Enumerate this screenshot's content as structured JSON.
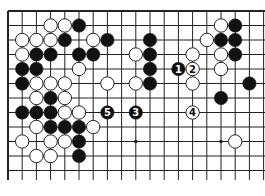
{
  "board": {
    "cols": 19,
    "rows_visible": 12,
    "origin_x": 8,
    "origin_y": 11,
    "spacing_x": 14.2,
    "spacing_y": 14.5,
    "line_bottom_y": 180,
    "line_right_x": 265,
    "edges": [
      "top",
      "left"
    ],
    "line_color": "#222222",
    "background": "#ffffff",
    "star_points": [
      [
        9,
        9
      ],
      [
        15,
        9
      ]
    ]
  },
  "stones": [
    {
      "c": 3,
      "r": 1,
      "color": "white"
    },
    {
      "c": 4,
      "r": 1,
      "color": "white"
    },
    {
      "c": 5,
      "r": 1,
      "color": "black"
    },
    {
      "c": 15,
      "r": 1,
      "color": "white"
    },
    {
      "c": 16,
      "r": 1,
      "color": "black"
    },
    {
      "c": 1,
      "r": 2,
      "color": "white"
    },
    {
      "c": 2,
      "r": 2,
      "color": "white"
    },
    {
      "c": 3,
      "r": 2,
      "color": "white"
    },
    {
      "c": 4,
      "r": 2,
      "color": "black"
    },
    {
      "c": 6,
      "r": 2,
      "color": "white"
    },
    {
      "c": 7,
      "r": 2,
      "color": "black"
    },
    {
      "c": 10,
      "r": 2,
      "color": "black"
    },
    {
      "c": 14,
      "r": 2,
      "color": "white"
    },
    {
      "c": 15,
      "r": 2,
      "color": "black"
    },
    {
      "c": 16,
      "r": 2,
      "color": "black"
    },
    {
      "c": 1,
      "r": 3,
      "color": "white"
    },
    {
      "c": 2,
      "r": 3,
      "color": "black"
    },
    {
      "c": 3,
      "r": 3,
      "color": "black"
    },
    {
      "c": 5,
      "r": 3,
      "color": "black"
    },
    {
      "c": 6,
      "r": 3,
      "color": "black"
    },
    {
      "c": 9,
      "r": 3,
      "color": "white"
    },
    {
      "c": 10,
      "r": 3,
      "color": "black"
    },
    {
      "c": 13,
      "r": 3,
      "color": "white"
    },
    {
      "c": 15,
      "r": 3,
      "color": "white"
    },
    {
      "c": 16,
      "r": 3,
      "color": "black"
    },
    {
      "c": 1,
      "r": 4,
      "color": "black"
    },
    {
      "c": 2,
      "r": 4,
      "color": "black"
    },
    {
      "c": 5,
      "r": 4,
      "color": "white"
    },
    {
      "c": 10,
      "r": 4,
      "color": "black"
    },
    {
      "c": 12,
      "r": 4,
      "color": "black",
      "label": "1"
    },
    {
      "c": 13,
      "r": 4,
      "color": "white",
      "label": "2"
    },
    {
      "c": 15,
      "r": 4,
      "color": "white"
    },
    {
      "c": 1,
      "r": 5,
      "color": "black"
    },
    {
      "c": 2,
      "r": 5,
      "color": "white"
    },
    {
      "c": 3,
      "r": 5,
      "color": "white"
    },
    {
      "c": 4,
      "r": 5,
      "color": "white"
    },
    {
      "c": 7,
      "r": 5,
      "color": "white"
    },
    {
      "c": 9,
      "r": 5,
      "color": "white"
    },
    {
      "c": 10,
      "r": 5,
      "color": "black"
    },
    {
      "c": 13,
      "r": 5,
      "color": "white"
    },
    {
      "c": 17,
      "r": 5,
      "color": "black"
    },
    {
      "c": 2,
      "r": 6,
      "color": "white"
    },
    {
      "c": 3,
      "r": 6,
      "color": "black"
    },
    {
      "c": 4,
      "r": 6,
      "color": "white"
    },
    {
      "c": 15,
      "r": 6,
      "color": "black"
    },
    {
      "c": 1,
      "r": 7,
      "color": "black"
    },
    {
      "c": 2,
      "r": 7,
      "color": "black"
    },
    {
      "c": 3,
      "r": 7,
      "color": "black"
    },
    {
      "c": 4,
      "r": 7,
      "color": "white"
    },
    {
      "c": 5,
      "r": 7,
      "color": "white"
    },
    {
      "c": 7,
      "r": 7,
      "color": "black",
      "label": "5"
    },
    {
      "c": 9,
      "r": 7,
      "color": "black",
      "label": "3"
    },
    {
      "c": 13,
      "r": 7,
      "color": "white",
      "label": "4"
    },
    {
      "c": 2,
      "r": 8,
      "color": "white"
    },
    {
      "c": 3,
      "r": 8,
      "color": "black"
    },
    {
      "c": 4,
      "r": 8,
      "color": "black"
    },
    {
      "c": 5,
      "r": 8,
      "color": "black"
    },
    {
      "c": 6,
      "r": 8,
      "color": "white"
    },
    {
      "c": 1,
      "r": 9,
      "color": "white"
    },
    {
      "c": 3,
      "r": 9,
      "color": "white"
    },
    {
      "c": 4,
      "r": 9,
      "color": "white"
    },
    {
      "c": 5,
      "r": 9,
      "color": "black"
    },
    {
      "c": 16,
      "r": 9,
      "color": "white"
    },
    {
      "c": 2,
      "r": 10,
      "color": "white"
    },
    {
      "c": 3,
      "r": 10,
      "color": "white"
    },
    {
      "c": 5,
      "r": 10,
      "color": "black"
    }
  ],
  "move_sequence": [
    "1",
    "2",
    "3",
    "4",
    "5"
  ]
}
